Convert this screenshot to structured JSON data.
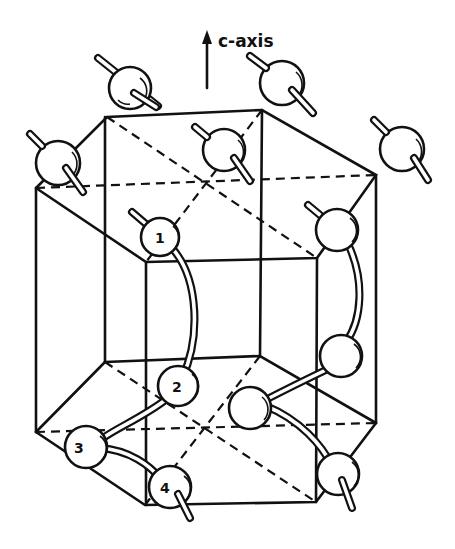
{
  "figure": {
    "type": "hexagonal crystal structure with helical atom chains",
    "axis_label": "c-axis",
    "atom_labels": [
      "1",
      "2",
      "3",
      "4"
    ]
  },
  "colors": {
    "ink": "#111111",
    "background": "#ffffff"
  }
}
